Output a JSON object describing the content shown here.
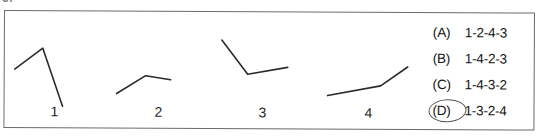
{
  "page": {
    "crop_fragment": "5.",
    "background_color": "#ffffff",
    "border_color": "#6b6b6b",
    "ink_color": "#2b2b2b"
  },
  "stimulus": {
    "figures": [
      {
        "caption": "1",
        "shape": "rise-then-steep-fall",
        "points": "10,40 38,19 58,77"
      },
      {
        "caption": "2",
        "shape": "rise-then-slight-fall",
        "points": "8,64 37,46 62,50"
      },
      {
        "caption": "3",
        "shape": "steep-fall-then-slight-rise",
        "points": "9,10 35,44 75,37"
      },
      {
        "caption": "4",
        "shape": "gentle-rise-then-steep-rise",
        "points": "9,65 62,55 89,36"
      }
    ]
  },
  "answers": {
    "options": [
      {
        "letter": "(A)",
        "sequence": "1-2-4-3",
        "selected": false
      },
      {
        "letter": "(B)",
        "sequence": "1-4-2-3",
        "selected": false
      },
      {
        "letter": "(C)",
        "sequence": "1-4-3-2",
        "selected": false
      },
      {
        "letter": "(D)",
        "sequence": "1-3-2-4",
        "selected": true
      }
    ],
    "selected_letter": "(D)",
    "selection_mark": "hand-drawn-ellipse"
  }
}
